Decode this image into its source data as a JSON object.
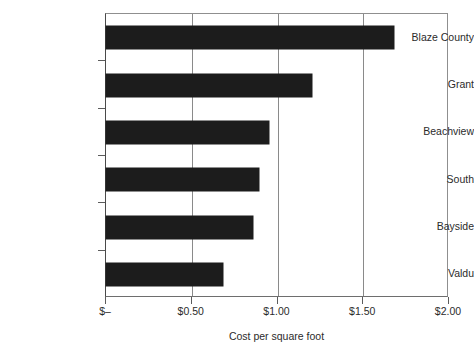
{
  "chart_data": {
    "type": "bar",
    "orientation": "horizontal",
    "title": "",
    "subtitle": "",
    "xlabel": "Cost per square foot",
    "ylabel": "",
    "categories": [
      "Blaze County",
      "Grant",
      "Beachview",
      "South",
      "Bayside",
      "Valdu"
    ],
    "values": [
      1.68,
      1.2,
      0.95,
      0.89,
      0.86,
      0.68
    ],
    "series": [
      {
        "name": "Cost per square foot",
        "values": [
          1.68,
          1.2,
          0.95,
          0.89,
          0.86,
          0.68
        ]
      }
    ],
    "xlim": [
      0,
      2.0
    ],
    "xticks": [
      0,
      0.5,
      1.0,
      1.5,
      2.0
    ],
    "xtick_labels": [
      "$–",
      "$0.50",
      "$1.00",
      "$1.50",
      "$2.00"
    ],
    "grid": "vertical",
    "legend": "none",
    "bar_color": "#1c1c1c",
    "background_color": "#ffffff",
    "axis_color": "#5c5c5c"
  }
}
